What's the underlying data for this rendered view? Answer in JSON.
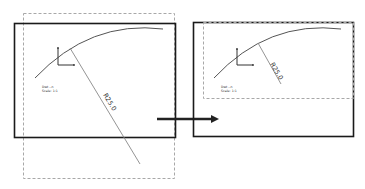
{
  "diagram": {
    "colors": {
      "frame": "#1a1a1a",
      "dashed": "#a8a8a8",
      "arc": "#555555",
      "radial": "#888888",
      "arrow": "#222222"
    },
    "left_panel": {
      "dimension_label": "R25.0",
      "note_line1": "Dwt --n",
      "note_line2": "Scale: 1:1"
    },
    "right_panel": {
      "dimension_label": "R25.0",
      "note_line1": "Dwt --n",
      "note_line2": "Scale: 1:1"
    },
    "arrow_label": ""
  }
}
